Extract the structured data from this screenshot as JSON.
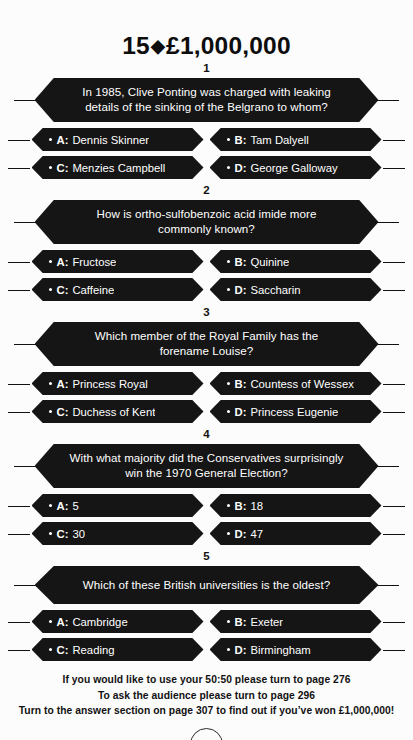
{
  "header": {
    "question_number": "15",
    "diamond_icon": "diamond-icon",
    "prize": "£1,000,000"
  },
  "questions": [
    {
      "number": "1",
      "text": "In 1985, Clive Ponting was charged with leaking details of the sinking of the Belgrano to whom?",
      "lines": 2,
      "answers": [
        {
          "letter": "A:",
          "text": "Dennis Skinner"
        },
        {
          "letter": "B:",
          "text": "Tam Dalyell"
        },
        {
          "letter": "C:",
          "text": "Menzies Campbell"
        },
        {
          "letter": "D:",
          "text": "George Galloway"
        }
      ]
    },
    {
      "number": "2",
      "text": "How is ortho-sulfobenzoic acid imide more commonly known?",
      "lines": 2,
      "answers": [
        {
          "letter": "A:",
          "text": "Fructose"
        },
        {
          "letter": "B:",
          "text": "Quinine"
        },
        {
          "letter": "C:",
          "text": "Caffeine"
        },
        {
          "letter": "D:",
          "text": "Saccharin"
        }
      ]
    },
    {
      "number": "3",
      "text": "Which member of the Royal Family has the forename Louise?",
      "lines": 2,
      "answers": [
        {
          "letter": "A:",
          "text": "Princess Royal"
        },
        {
          "letter": "B:",
          "text": "Countess of Wessex"
        },
        {
          "letter": "C:",
          "text": "Duchess of Kent"
        },
        {
          "letter": "D:",
          "text": "Princess Eugenie"
        }
      ]
    },
    {
      "number": "4",
      "text": "With what majority did the Conservatives surprisingly win the 1970 General Election?",
      "lines": 2,
      "answers": [
        {
          "letter": "A:",
          "text": "5"
        },
        {
          "letter": "B:",
          "text": "18"
        },
        {
          "letter": "C:",
          "text": "30"
        },
        {
          "letter": "D:",
          "text": "47"
        }
      ]
    },
    {
      "number": "5",
      "text": "Which of these British universities is the oldest?",
      "lines": 1,
      "answers": [
        {
          "letter": "A:",
          "text": "Cambridge"
        },
        {
          "letter": "B:",
          "text": "Exeter"
        },
        {
          "letter": "C:",
          "text": "Reading"
        },
        {
          "letter": "D:",
          "text": "Birmingham"
        }
      ]
    }
  ],
  "footer": {
    "line1": "If you would like to use your 50:50 please turn to page 276",
    "line2": "To ask the audience please turn to page 296",
    "line3": "Turn to the answer section on page 307 to find out if you’ve won £1,000,000!",
    "page_number": "246"
  },
  "colors": {
    "hex_fill": "#151515",
    "hex_text": "#ffffff",
    "page_bg": "#fcfcfc",
    "ink": "#111111"
  }
}
